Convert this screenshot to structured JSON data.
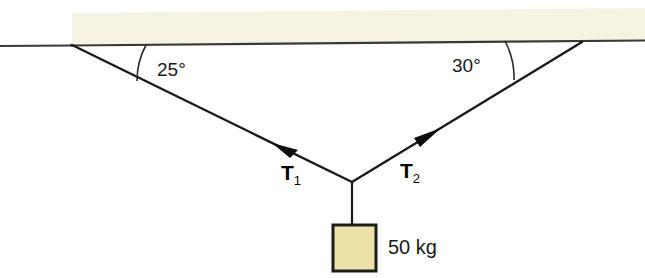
{
  "figure": {
    "background_color": "#ffffff"
  },
  "ceiling": {
    "name": "ceiling-beam",
    "fill_color": "#f6f3e2",
    "edge_color": "#3a3a38"
  },
  "angles": {
    "left": {
      "label": "25°",
      "value": 25,
      "unit": "degrees",
      "measured_from": "ceiling"
    },
    "right": {
      "label": "30°",
      "value": 30,
      "unit": "degrees",
      "measured_from": "ceiling"
    }
  },
  "tensions": {
    "left": {
      "symbol": "T",
      "subscript": "1",
      "direction": "up-left"
    },
    "right": {
      "symbol": "T",
      "subscript": "2",
      "direction": "up-right"
    }
  },
  "block": {
    "label": "50 kg",
    "mass_value": 50,
    "mass_unit": "kg",
    "fill_color": "#ece2a8",
    "edge_color": "#1c1c18"
  },
  "colors": {
    "line": "#1a1a1a",
    "ceiling_fill": "#f6f3e2",
    "block_fill": "#ece2a8"
  }
}
